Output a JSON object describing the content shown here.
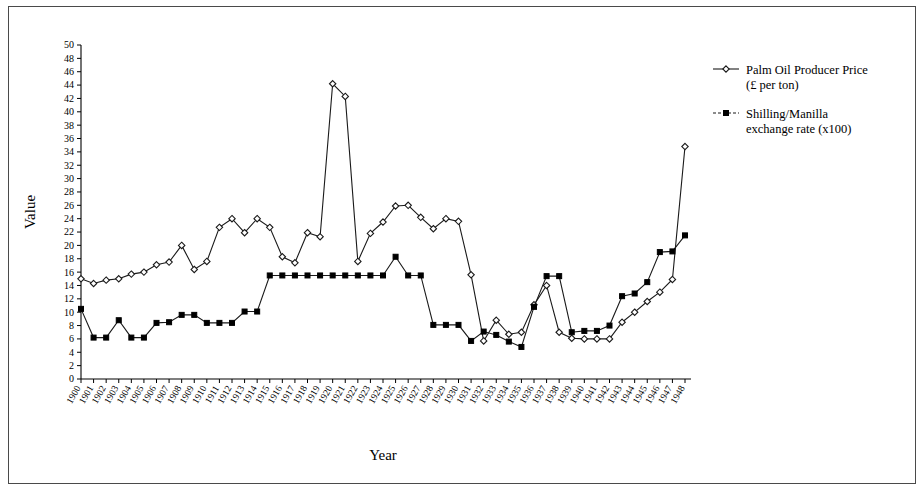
{
  "figure": {
    "background": "#ffffff",
    "border_color": "#4a4a4a"
  },
  "chart_data": {
    "type": "line",
    "title": "",
    "xlabel": "Year",
    "ylabel": "Value",
    "ylim": [
      0,
      50
    ],
    "ytick_step": 2,
    "grid": false,
    "legend_position": "right",
    "x": [
      1900,
      1901,
      1902,
      1903,
      1904,
      1905,
      1906,
      1907,
      1908,
      1909,
      1910,
      1911,
      1912,
      1913,
      1914,
      1915,
      1916,
      1917,
      1918,
      1919,
      1920,
      1921,
      1922,
      1923,
      1924,
      1925,
      1926,
      1927,
      1928,
      1929,
      1930,
      1931,
      1932,
      1933,
      1934,
      1935,
      1936,
      1937,
      1938,
      1939,
      1940,
      1941,
      1942,
      1943,
      1944,
      1945,
      1946,
      1947,
      1948
    ],
    "categories": [
      "1900",
      "1901",
      "1902",
      "1903",
      "1904",
      "1905",
      "1906",
      "1907",
      "1908",
      "1909",
      "1910",
      "1911",
      "1912",
      "1913",
      "1914",
      "1915",
      "1916",
      "1917",
      "1918",
      "1919",
      "1920",
      "1921",
      "1922",
      "1923",
      "1924",
      "1925",
      "1926",
      "1927",
      "1928",
      "1929",
      "1930",
      "1931",
      "1932",
      "1933",
      "1934",
      "1935",
      "1936",
      "1937",
      "1938",
      "1939",
      "1940",
      "1941",
      "1942",
      "1943",
      "1944",
      "1945",
      "1946",
      "1947",
      "1948"
    ],
    "yticks": [
      0,
      2,
      4,
      6,
      8,
      10,
      12,
      14,
      16,
      18,
      20,
      22,
      24,
      26,
      28,
      30,
      32,
      34,
      36,
      38,
      40,
      42,
      44,
      46,
      48,
      50
    ],
    "series": [
      {
        "name": "Palm Oil Producer Price (£ per ton)",
        "marker": "open-diamond",
        "color": "#1a1a1a",
        "values": [
          15.0,
          14.3,
          14.8,
          15.0,
          15.7,
          16.0,
          17.1,
          17.5,
          20.0,
          16.4,
          17.6,
          22.7,
          24.0,
          21.9,
          24.0,
          22.7,
          18.3,
          17.4,
          21.9,
          21.3,
          44.2,
          42.3,
          17.6,
          21.8,
          23.5,
          25.9,
          26.0,
          24.2,
          22.5,
          24.0,
          23.6,
          15.6,
          5.7,
          8.8,
          6.7,
          7.0,
          11.1,
          14.0,
          7.0,
          6.1,
          6.0,
          6.0,
          6.0,
          8.5,
          10.0,
          11.6,
          13.0,
          14.9,
          34.8
        ]
      },
      {
        "name": "Shilling/Manilla exchange rate (x100)",
        "marker": "filled-square",
        "color": "#000000",
        "values": [
          10.5,
          6.2,
          6.2,
          8.8,
          6.2,
          6.2,
          8.4,
          8.5,
          9.6,
          9.6,
          8.4,
          8.4,
          8.4,
          10.1,
          10.1,
          15.5,
          15.5,
          15.5,
          15.5,
          15.5,
          15.5,
          15.5,
          15.5,
          15.5,
          15.5,
          18.3,
          15.5,
          15.5,
          8.1,
          8.1,
          8.1,
          5.7,
          7.1,
          6.6,
          5.6,
          4.8,
          10.8,
          15.4,
          15.4,
          7.0,
          7.2,
          7.2,
          8.0,
          12.4,
          12.8,
          14.5,
          19.0,
          19.1,
          21.5
        ]
      }
    ]
  },
  "legend": {
    "entries": [
      {
        "label_line1": "Palm Oil Producer Price",
        "label_line2": "(£ per ton)",
        "marker": "open-diamond"
      },
      {
        "label_line1": "Shilling/Manilla",
        "label_line2": "exchange rate (x100)",
        "marker": "filled-square"
      }
    ]
  }
}
